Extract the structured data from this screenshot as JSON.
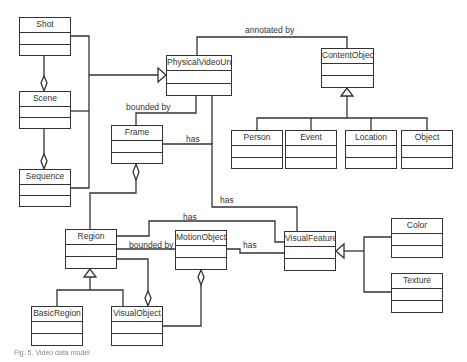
{
  "diagram": {
    "type": "UML class diagram",
    "classes": [
      {
        "id": "shot",
        "name": "Shot",
        "x": 19,
        "y": 17,
        "w": 52,
        "h": 39
      },
      {
        "id": "scene",
        "name": "Scene",
        "x": 19,
        "y": 91,
        "w": 52,
        "h": 38
      },
      {
        "id": "sequence",
        "name": "Sequence",
        "x": 19,
        "y": 169,
        "w": 52,
        "h": 38
      },
      {
        "id": "physicalvideounit",
        "name": "PhysicalVideoUnit",
        "x": 166,
        "y": 55,
        "w": 66,
        "h": 41
      },
      {
        "id": "contentobject",
        "name": "ContentObject",
        "x": 321,
        "y": 48,
        "w": 53,
        "h": 40
      },
      {
        "id": "person",
        "name": "Person",
        "x": 231,
        "y": 130,
        "w": 52,
        "h": 39
      },
      {
        "id": "event",
        "name": "Event",
        "x": 285,
        "y": 130,
        "w": 52,
        "h": 39
      },
      {
        "id": "location",
        "name": "Location",
        "x": 345,
        "y": 130,
        "w": 52,
        "h": 39
      },
      {
        "id": "object",
        "name": "Object",
        "x": 401,
        "y": 130,
        "w": 52,
        "h": 39
      },
      {
        "id": "frame",
        "name": "Frame",
        "x": 111,
        "y": 125,
        "w": 52,
        "h": 39
      },
      {
        "id": "region",
        "name": "Region",
        "x": 65,
        "y": 229,
        "w": 52,
        "h": 40
      },
      {
        "id": "motionobject",
        "name": "MotionObject",
        "x": 175,
        "y": 230,
        "w": 52,
        "h": 40
      },
      {
        "id": "visualfeature",
        "name": "VisualFeature",
        "x": 284,
        "y": 231,
        "w": 52,
        "h": 40
      },
      {
        "id": "color",
        "name": "Color",
        "x": 391,
        "y": 218,
        "w": 52,
        "h": 40
      },
      {
        "id": "texture",
        "name": "Texture",
        "x": 391,
        "y": 273,
        "w": 52,
        "h": 40
      },
      {
        "id": "basicregion",
        "name": "BasicRegion",
        "x": 31,
        "y": 306,
        "w": 52,
        "h": 40
      },
      {
        "id": "visualobject",
        "name": "VisualObject",
        "x": 111,
        "y": 306,
        "w": 52,
        "h": 40
      }
    ],
    "labels": [
      {
        "id": "annotated-by",
        "text": "annotated by",
        "x": 245,
        "y": 29
      },
      {
        "id": "bounded-by-frame",
        "text": "bounded by",
        "x": 126,
        "y": 102
      },
      {
        "id": "has-frame-visualfeature",
        "text": "has",
        "x": 186,
        "y": 135
      },
      {
        "id": "has-pvu-visualfeature",
        "text": "has",
        "x": 220,
        "y": 195
      },
      {
        "id": "has-region-visualfeature",
        "text": "has",
        "x": 183,
        "y": 212
      },
      {
        "id": "bounded-by-motion",
        "text": "bounded by",
        "x": 129,
        "y": 240
      },
      {
        "id": "has-motion-visualfeature",
        "text": "has",
        "x": 243,
        "y": 240
      }
    ],
    "relationships": [
      {
        "from": "Shot",
        "to": "PhysicalVideoUnit",
        "type": "generalization"
      },
      {
        "from": "Scene",
        "to": "PhysicalVideoUnit",
        "type": "generalization"
      },
      {
        "from": "Sequence",
        "to": "PhysicalVideoUnit",
        "type": "generalization"
      },
      {
        "from": "Shot",
        "to": "Scene",
        "type": "aggregation"
      },
      {
        "from": "Scene",
        "to": "Sequence",
        "type": "aggregation"
      },
      {
        "from": "PhysicalVideoUnit",
        "to": "ContentObject",
        "type": "association",
        "label": "annotated by"
      },
      {
        "from": "Person",
        "to": "ContentObject",
        "type": "generalization"
      },
      {
        "from": "Event",
        "to": "ContentObject",
        "type": "generalization"
      },
      {
        "from": "Location",
        "to": "ContentObject",
        "type": "generalization"
      },
      {
        "from": "Object",
        "to": "ContentObject",
        "type": "generalization"
      },
      {
        "from": "Frame",
        "to": "PhysicalVideoUnit",
        "type": "association",
        "label": "bounded by"
      },
      {
        "from": "Frame",
        "to": "VisualFeature",
        "type": "association",
        "label": "has"
      },
      {
        "from": "PhysicalVideoUnit",
        "to": "VisualFeature",
        "type": "association",
        "label": "has"
      },
      {
        "from": "Region",
        "to": "Frame",
        "type": "aggregation"
      },
      {
        "from": "Region",
        "to": "VisualFeature",
        "type": "association",
        "label": "has"
      },
      {
        "from": "Region",
        "to": "MotionObject",
        "type": "association",
        "label": "bounded by"
      },
      {
        "from": "MotionObject",
        "to": "VisualFeature",
        "type": "association",
        "label": "has"
      },
      {
        "from": "BasicRegion",
        "to": "Region",
        "type": "generalization"
      },
      {
        "from": "VisualObject",
        "to": "Region",
        "type": "generalization"
      },
      {
        "from": "VisualObject",
        "to": "Region",
        "type": "aggregation"
      },
      {
        "from": "VisualObject",
        "to": "MotionObject",
        "type": "aggregation"
      },
      {
        "from": "Color",
        "to": "VisualFeature",
        "type": "generalization"
      },
      {
        "from": "Texture",
        "to": "VisualFeature",
        "type": "generalization"
      }
    ]
  },
  "caption": {
    "text": "Fig. 5. Video data model"
  },
  "colors": {
    "line": "#333333",
    "background": "#ffffff",
    "caption": "#888888"
  }
}
